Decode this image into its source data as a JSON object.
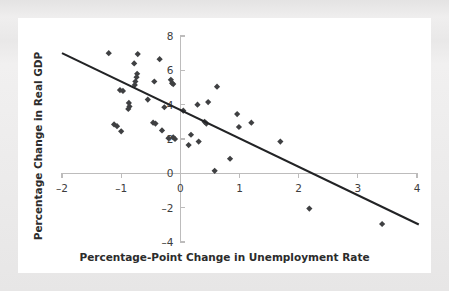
{
  "figure": {
    "background_color": "#eceaea",
    "card_color": "#ffffff",
    "marker_color": "#3f4042",
    "line_color": "#222325",
    "axis_color": "#bdbcbc"
  },
  "chart_data": {
    "type": "scatter",
    "title": "",
    "xlabel": "Percentage-Point Change in Unemployment Rate",
    "ylabel": "Percentage Change in Real GDP",
    "xlim": [
      -2,
      4
    ],
    "ylim": [
      -4,
      8
    ],
    "xticks": [
      -2,
      -1,
      0,
      1,
      2,
      3,
      4
    ],
    "xtick_labels": [
      "–2",
      "–1",
      "0",
      "1",
      "2",
      "3",
      "4"
    ],
    "yticks": [
      -4,
      -2,
      0,
      2,
      4,
      6,
      8
    ],
    "ytick_labels": [
      "–4",
      "–2",
      "0",
      "2",
      "4",
      "6",
      "8"
    ],
    "grid": false,
    "legend": null,
    "points": [
      {
        "x": -1.21,
        "y": 7.0
      },
      {
        "x": -0.72,
        "y": 6.95
      },
      {
        "x": -0.78,
        "y": 6.4
      },
      {
        "x": -0.35,
        "y": 6.65
      },
      {
        "x": -0.73,
        "y": 5.8
      },
      {
        "x": -0.74,
        "y": 5.6
      },
      {
        "x": -0.76,
        "y": 5.35
      },
      {
        "x": -0.77,
        "y": 5.15
      },
      {
        "x": -0.44,
        "y": 5.35
      },
      {
        "x": -0.16,
        "y": 5.45
      },
      {
        "x": -0.14,
        "y": 5.25
      },
      {
        "x": -0.12,
        "y": 5.2
      },
      {
        "x": 0.62,
        "y": 5.05
      },
      {
        "x": -1.02,
        "y": 4.85
      },
      {
        "x": -0.97,
        "y": 4.8
      },
      {
        "x": -0.55,
        "y": 4.3
      },
      {
        "x": -0.87,
        "y": 4.1
      },
      {
        "x": -0.86,
        "y": 3.9
      },
      {
        "x": -0.88,
        "y": 3.75
      },
      {
        "x": -0.27,
        "y": 3.85
      },
      {
        "x": 0.05,
        "y": 3.65
      },
      {
        "x": 0.29,
        "y": 4.0
      },
      {
        "x": 0.47,
        "y": 4.15
      },
      {
        "x": 0.96,
        "y": 3.45
      },
      {
        "x": -1.12,
        "y": 2.85
      },
      {
        "x": -1.07,
        "y": 2.75
      },
      {
        "x": -1.0,
        "y": 2.45
      },
      {
        "x": -0.46,
        "y": 2.95
      },
      {
        "x": -0.42,
        "y": 2.9
      },
      {
        "x": 0.41,
        "y": 3.0
      },
      {
        "x": 0.44,
        "y": 2.9
      },
      {
        "x": 0.99,
        "y": 2.7
      },
      {
        "x": 1.2,
        "y": 2.95
      },
      {
        "x": -0.31,
        "y": 2.5
      },
      {
        "x": -0.2,
        "y": 2.05
      },
      {
        "x": -0.12,
        "y": 2.1
      },
      {
        "x": -0.09,
        "y": 2.0
      },
      {
        "x": 0.18,
        "y": 2.25
      },
      {
        "x": 0.14,
        "y": 1.65
      },
      {
        "x": 0.31,
        "y": 1.85
      },
      {
        "x": 1.69,
        "y": 1.85
      },
      {
        "x": 0.84,
        "y": 0.85
      },
      {
        "x": 0.58,
        "y": 0.15
      },
      {
        "x": 2.18,
        "y": -2.05
      },
      {
        "x": 3.41,
        "y": -2.95
      }
    ],
    "trend_line": {
      "x0": -2.0,
      "y0": 7.0,
      "x1": 4.03,
      "y1": -2.98
    }
  }
}
